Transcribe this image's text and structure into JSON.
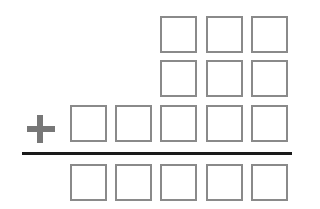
{
  "worksheet": {
    "operator": "+",
    "operator_icon": "plus-icon",
    "colors": {
      "box_border": "#8a8a8a",
      "operator": "#777777",
      "rule": "#1a1a1a"
    },
    "rows": [
      {
        "name": "addend-row-1",
        "boxes": 3
      },
      {
        "name": "addend-row-2",
        "boxes": 3
      },
      {
        "name": "addend-row-3",
        "boxes": 5
      },
      {
        "name": "sum-row",
        "boxes": 5
      }
    ]
  }
}
